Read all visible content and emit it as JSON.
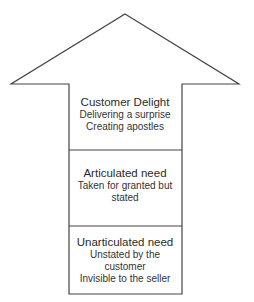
{
  "diagram": {
    "type": "upward-arrow-stack",
    "stroke_color": "#444444",
    "levels": [
      {
        "title": "Customer Delight",
        "lines": [
          "Delivering a surprise",
          "Creating apostles"
        ]
      },
      {
        "title": "Articulated need",
        "lines": [
          "Taken for granted but",
          "stated"
        ]
      },
      {
        "title": "Unarticulated need",
        "lines": [
          "Unstated by the",
          "customer",
          "Invisible to the seller"
        ]
      }
    ]
  }
}
